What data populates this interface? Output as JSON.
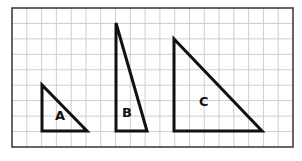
{
  "diagram": {
    "type": "grid-with-triangles",
    "grid": {
      "left": 12,
      "top": 8,
      "right": 293,
      "bottom": 147,
      "cols": 19,
      "rows": 9,
      "line_color": "#cfcfcf",
      "border_color": "#333333"
    },
    "triangles": [
      {
        "label": "A",
        "width_units": 3,
        "height_units": 3,
        "points": "42,85 42,131 87,131",
        "label_x": 55,
        "label_y": 120
      },
      {
        "label": "B",
        "width_units": 2,
        "height_units": 7,
        "points": "116,23 116,131 147,131",
        "label_x": 122,
        "label_y": 117
      },
      {
        "label": "C",
        "width_units": 6,
        "height_units": 6,
        "points": "174,39 174,131 262,131",
        "label_x": 199,
        "label_y": 106
      }
    ]
  }
}
